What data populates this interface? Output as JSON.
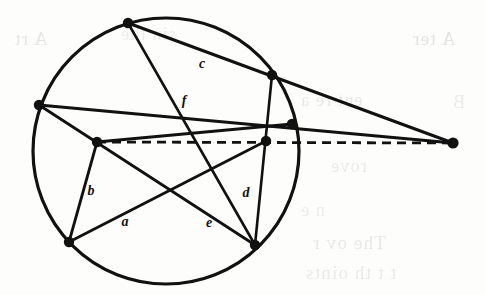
{
  "figure": {
    "background_color": "#fdfdfb",
    "ink_color": "#111111",
    "canvas": {
      "width": 485,
      "height": 295
    },
    "circle": {
      "cx": 166,
      "cy": 151,
      "r": 133,
      "stroke_width": 3.2
    },
    "vertices": [
      {
        "id": "P1",
        "name": "top-vertex",
        "x": 128,
        "y": 23,
        "r": 5.2
      },
      {
        "id": "P2",
        "name": "upper-right-vertex",
        "x": 272,
        "y": 75,
        "r": 5.2
      },
      {
        "id": "P3",
        "name": "right-vertex",
        "x": 292,
        "y": 124,
        "r": 5.2
      },
      {
        "id": "P4",
        "name": "inner-right-vertex",
        "x": 266,
        "y": 141,
        "r": 5.2
      },
      {
        "id": "P5",
        "name": "bottom-right-vertex",
        "x": 255,
        "y": 245,
        "r": 5.2
      },
      {
        "id": "P6",
        "name": "bottom-left-vertex",
        "x": 69,
        "y": 242,
        "r": 5.2
      },
      {
        "id": "P7",
        "name": "inner-left-vertex",
        "x": 97,
        "y": 142,
        "r": 5.2
      },
      {
        "id": "P8",
        "name": "left-vertex",
        "x": 39,
        "y": 105,
        "r": 5.2
      },
      {
        "id": "P9",
        "name": "external-point",
        "x": 453,
        "y": 143,
        "r": 5.6
      }
    ],
    "solid_lines": [
      {
        "name": "chord-top-to-external",
        "from": "P1",
        "to": "P9",
        "width": 3.0
      },
      {
        "name": "chord-top-to-bottom-right",
        "from": "P1",
        "to": "P5",
        "width": 2.6
      },
      {
        "name": "chord-left-to-external",
        "from": "P8",
        "to": "P9",
        "width": 2.8
      },
      {
        "name": "chord-left-to-bottom-right",
        "from": "P8",
        "to": "P5",
        "width": 2.8
      },
      {
        "name": "chord-inner-left-to-right",
        "from": "P7",
        "to": "P3",
        "width": 2.8
      },
      {
        "name": "chord-inner-left-to-bottom-left",
        "from": "P7",
        "to": "P6",
        "width": 2.8
      },
      {
        "name": "chord-bottom-left-to-inner-right",
        "from": "P6",
        "to": "P4",
        "width": 2.8
      },
      {
        "name": "chord-upper-right-to-bottom-right",
        "from": "P2",
        "to": "P5",
        "width": 2.6
      }
    ],
    "dashed_lines": [
      {
        "name": "dashed-axis",
        "from": "P7",
        "to": "P9",
        "width": 2.8,
        "dash": "9 6"
      }
    ],
    "segment_labels": [
      {
        "id": "c",
        "text": "c",
        "x": 202,
        "y": 68
      },
      {
        "id": "f",
        "text": "f",
        "x": 184,
        "y": 105
      },
      {
        "id": "b",
        "text": "b",
        "x": 91,
        "y": 195
      },
      {
        "id": "d",
        "text": "d",
        "x": 246,
        "y": 197
      },
      {
        "id": "a",
        "text": "a",
        "x": 125,
        "y": 226
      },
      {
        "id": "e",
        "text": "e",
        "x": 209,
        "y": 227
      }
    ],
    "bleed_through_text": [
      {
        "text": "A  rt",
        "x": 14,
        "y": 28,
        "size": 19,
        "opacity": 0.3
      },
      {
        "text": "sin   the",
        "x": 120,
        "y": 24,
        "size": 18,
        "opacity": 0.22
      },
      {
        "text": "A  ter",
        "x": 412,
        "y": 28,
        "size": 19,
        "opacity": 0.34
      },
      {
        "text": "ent    re  a",
        "x": 300,
        "y": 90,
        "size": 18,
        "opacity": 0.26
      },
      {
        "text": "B",
        "x": 452,
        "y": 92,
        "size": 18,
        "opacity": 0.24
      },
      {
        "text": "rove",
        "x": 330,
        "y": 156,
        "size": 18,
        "opacity": 0.26
      },
      {
        "text": "n  e",
        "x": 300,
        "y": 200,
        "size": 18,
        "opacity": 0.22
      },
      {
        "text": "The   ov  r",
        "x": 312,
        "y": 232,
        "size": 19,
        "opacity": 0.28
      },
      {
        "text": "t t  th    oints",
        "x": 305,
        "y": 262,
        "size": 19,
        "opacity": 0.26
      }
    ]
  }
}
